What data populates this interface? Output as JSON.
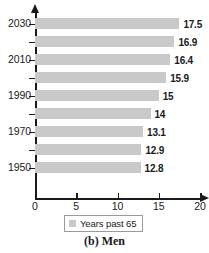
{
  "chart_data": {
    "type": "bar",
    "orientation": "horizontal",
    "title": "",
    "xlabel": "",
    "ylabel": "",
    "categories": [
      "1950",
      "1960",
      "1970",
      "1980",
      "1990",
      "2000",
      "2010",
      "2020",
      "2030"
    ],
    "values": [
      12.8,
      12.9,
      13.1,
      14,
      15,
      15.9,
      16.4,
      16.9,
      17.5
    ],
    "value_labels": [
      "12.8",
      "12.9",
      "13.1",
      "14",
      "15",
      "15.9",
      "16.4",
      "16.9",
      "17.5"
    ],
    "visible_category_labels": [
      "1950",
      "",
      "1970",
      "",
      "1990",
      "",
      "2010",
      "",
      "2030"
    ],
    "xlim": [
      0,
      20
    ],
    "xticks": [
      0,
      5,
      10,
      15,
      20
    ],
    "xtick_labels": [
      "0",
      "5",
      "10",
      "15",
      "20"
    ],
    "grid": false,
    "legend": {
      "position": "bottom",
      "entries": [
        {
          "label": "Years past 65",
          "color": "#c9c9c9"
        }
      ]
    },
    "series": [
      {
        "name": "Years past 65",
        "color": "#c9c9c9",
        "values": [
          12.8,
          12.9,
          13.1,
          14,
          15,
          15.9,
          16.4,
          16.9,
          17.5
        ]
      }
    ],
    "bars": [
      {
        "category": "2030",
        "value": 17.5,
        "label": "17.5",
        "axis_label": "2030"
      },
      {
        "category": "2020",
        "value": 16.9,
        "label": "16.9",
        "axis_label": ""
      },
      {
        "category": "2010",
        "value": 16.4,
        "label": "16.4",
        "axis_label": "2010"
      },
      {
        "category": "2000",
        "value": 15.9,
        "label": "15.9",
        "axis_label": ""
      },
      {
        "category": "1990",
        "value": 15,
        "label": "15",
        "axis_label": "1990"
      },
      {
        "category": "1980",
        "value": 14,
        "label": "14",
        "axis_label": ""
      },
      {
        "category": "1970",
        "value": 13.1,
        "label": "13.1",
        "axis_label": "1970"
      },
      {
        "category": "1960",
        "value": 12.9,
        "label": "12.9",
        "axis_label": ""
      },
      {
        "category": "1950",
        "value": 12.8,
        "label": "12.8",
        "axis_label": "1950"
      }
    ]
  },
  "axes": {
    "y_labels": [
      "2030",
      "2010",
      "1990",
      "1970",
      "1950"
    ],
    "x_labels": [
      "0",
      "5",
      "10",
      "15",
      "20"
    ]
  },
  "legend": {
    "label": "Years past 65"
  },
  "caption": {
    "text": "(b) Men"
  },
  "colors": {
    "bar": "#c9c9c9",
    "axis": "#1a1a1a",
    "text": "#1a1a1a",
    "legend_border": "#9a9a9a",
    "background": "#ffffff"
  }
}
